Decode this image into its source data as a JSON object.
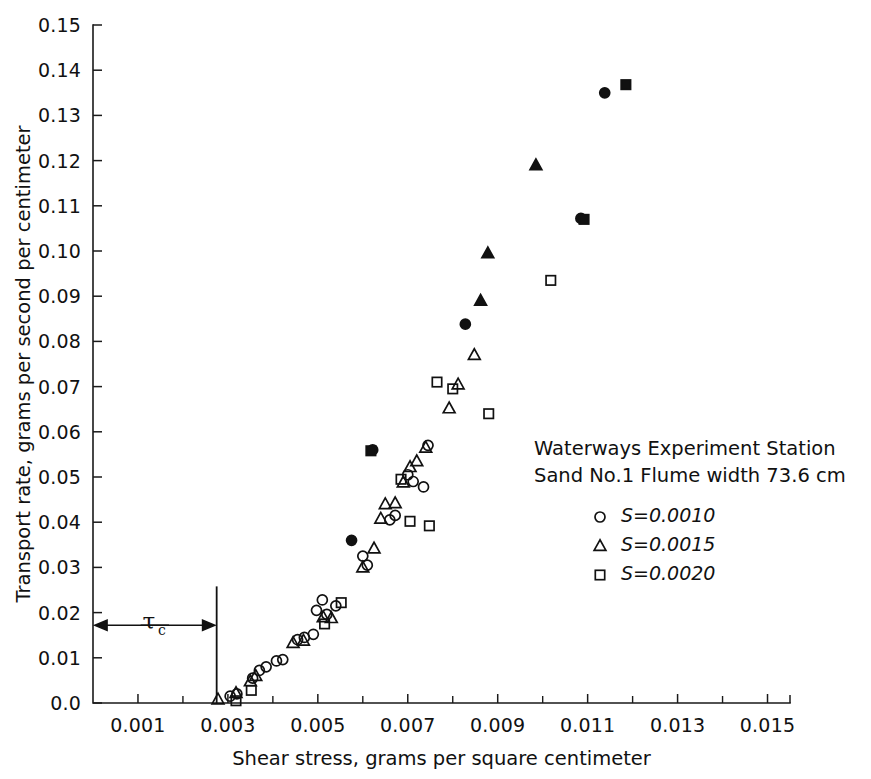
{
  "chart_data": {
    "type": "scatter",
    "title": "",
    "xlabel": "Shear stress, grams per square centimeter",
    "ylabel": "Transport rate, grams per second per centimeter",
    "xlim": [
      0.0,
      0.0155
    ],
    "ylim": [
      0.0,
      0.15
    ],
    "xticks": [
      0.001,
      0.003,
      0.005,
      0.007,
      0.009,
      0.011,
      0.013,
      0.015
    ],
    "xticklabels": [
      "0.001",
      "0.003",
      "0.005",
      "0.007",
      "0.009",
      "0.011",
      "0.013",
      "0.015"
    ],
    "xminorticks": [
      0.002,
      0.004,
      0.006,
      0.008,
      0.01,
      0.012,
      0.014
    ],
    "yticks": [
      0.0,
      0.01,
      0.02,
      0.03,
      0.04,
      0.05,
      0.06,
      0.07,
      0.08,
      0.09,
      0.1,
      0.11,
      0.12,
      0.13,
      0.14,
      0.15
    ],
    "yticklabels": [
      "0.0",
      "0.01",
      "0.02",
      "0.03",
      "0.04",
      "0.05",
      "0.06",
      "0.07",
      "0.08",
      "0.09",
      "0.10",
      "0.11",
      "0.12",
      "0.13",
      "0.14",
      "0.15"
    ],
    "grid": false,
    "legend_position": "center-right",
    "legend_heading_line1": "Waterways Experiment Station",
    "legend_heading_line2": "Sand No.1  Flume width 73.6 cm",
    "annotation": {
      "label": "τ",
      "subscript": "c",
      "threshold_x": 0.00275,
      "arrow_y": 0.0172
    },
    "series": [
      {
        "name": "S = 0.0010",
        "marker": "circle",
        "legend_label": "S=0.0010",
        "points": [
          [
            0.00305,
            0.0015
          ],
          [
            0.0032,
            0.002
          ],
          [
            0.00355,
            0.0055
          ],
          [
            0.0037,
            0.0072
          ],
          [
            0.00385,
            0.008
          ],
          [
            0.00408,
            0.0093
          ],
          [
            0.00422,
            0.0096
          ],
          [
            0.00455,
            0.014
          ],
          [
            0.0047,
            0.0145
          ],
          [
            0.0049,
            0.0152
          ],
          [
            0.0051,
            0.0228
          ],
          [
            0.00497,
            0.0205
          ],
          [
            0.0052,
            0.0196
          ],
          [
            0.0054,
            0.0215
          ],
          [
            0.00575,
            0.036
          ],
          [
            0.006,
            0.0325
          ],
          [
            0.0061,
            0.0305
          ],
          [
            0.00622,
            0.056
          ],
          [
            0.0066,
            0.0405
          ],
          [
            0.00672,
            0.0415
          ],
          [
            0.007,
            0.0505
          ],
          [
            0.00712,
            0.049
          ],
          [
            0.00735,
            0.0478
          ],
          [
            0.00745,
            0.057
          ],
          [
            0.00828,
            0.0838
          ],
          [
            0.01085,
            0.1072
          ],
          [
            0.01138,
            0.135
          ]
        ]
      },
      {
        "name": "S = 0.0015",
        "marker": "triangle",
        "legend_label": "S=0.0015",
        "points": [
          [
            0.00278,
            0.0008
          ],
          [
            0.00318,
            0.0022
          ],
          [
            0.0035,
            0.0048
          ],
          [
            0.00362,
            0.006
          ],
          [
            0.00445,
            0.0133
          ],
          [
            0.00468,
            0.0138
          ],
          [
            0.00512,
            0.019
          ],
          [
            0.0053,
            0.0188
          ],
          [
            0.006,
            0.03
          ],
          [
            0.00625,
            0.0342
          ],
          [
            0.0064,
            0.0408
          ],
          [
            0.0065,
            0.044
          ],
          [
            0.00672,
            0.0442
          ],
          [
            0.0069,
            0.0488
          ],
          [
            0.00705,
            0.0522
          ],
          [
            0.0072,
            0.0535
          ],
          [
            0.0074,
            0.0565
          ],
          [
            0.00792,
            0.0652
          ],
          [
            0.00812,
            0.0705
          ],
          [
            0.00848,
            0.077
          ],
          [
            0.00862,
            0.089
          ],
          [
            0.00878,
            0.0995
          ],
          [
            0.00985,
            0.119
          ]
        ]
      },
      {
        "name": "S = 0.0020",
        "marker": "square",
        "legend_label": "S=0.0020",
        "points": [
          [
            0.00318,
            0.0005
          ],
          [
            0.00352,
            0.0028
          ],
          [
            0.00515,
            0.0175
          ],
          [
            0.00552,
            0.0222
          ],
          [
            0.00618,
            0.0558
          ],
          [
            0.00685,
            0.0495
          ],
          [
            0.00705,
            0.0402
          ],
          [
            0.00748,
            0.0392
          ],
          [
            0.00765,
            0.071
          ],
          [
            0.008,
            0.0695
          ],
          [
            0.0088,
            0.064
          ],
          [
            0.01018,
            0.0935
          ],
          [
            0.01092,
            0.107
          ],
          [
            0.01185,
            0.1368
          ]
        ]
      }
    ]
  }
}
